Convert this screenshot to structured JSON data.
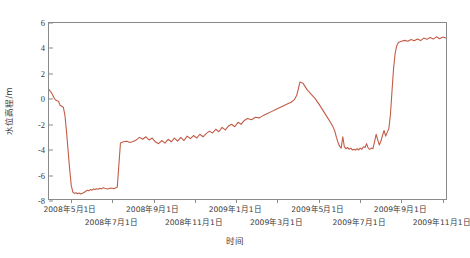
{
  "chart_data": {
    "type": "line",
    "title": "",
    "xlabel": "时间",
    "ylabel": "水位高程/m",
    "ylim": [
      -8,
      6
    ],
    "ytick_values": [
      6,
      4,
      2,
      0,
      -2,
      -4,
      -6,
      -8
    ],
    "ytick_labels": [
      "6",
      "4",
      "2",
      "0",
      "-2",
      "-4",
      "-6",
      "-8"
    ],
    "grid": false,
    "legend": null,
    "line_color": "#c35b46",
    "axis_color": "#8a8a8a",
    "xtick_labels": [
      {
        "text": "2008年5月1日",
        "row": 0,
        "index": 0
      },
      {
        "text": "2008年7月1日",
        "row": 1,
        "index": 1
      },
      {
        "text": "2008年9月1日",
        "row": 0,
        "index": 2
      },
      {
        "text": "2008年11月1日",
        "row": 1,
        "index": 3
      },
      {
        "text": "2009年1月1日",
        "row": 0,
        "index": 4
      },
      {
        "text": "2009年3月1日",
        "row": 1,
        "index": 5
      },
      {
        "text": "2009年5月1日",
        "row": 0,
        "index": 6
      },
      {
        "text": "2009年7月1日",
        "row": 1,
        "index": 7
      },
      {
        "text": "2009年9月1日",
        "row": 0,
        "index": 8
      },
      {
        "text": "2009年11月1日",
        "row": 1,
        "index": 9
      }
    ],
    "x": [
      0.0,
      0.004,
      0.008,
      0.012,
      0.016,
      0.02,
      0.024,
      0.028,
      0.032,
      0.036,
      0.04,
      0.044,
      0.048,
      0.052,
      0.056,
      0.06,
      0.064,
      0.068,
      0.072,
      0.076,
      0.08,
      0.084,
      0.088,
      0.092,
      0.096,
      0.1,
      0.104,
      0.108,
      0.112,
      0.116,
      0.12,
      0.124,
      0.128,
      0.132,
      0.136,
      0.14,
      0.148,
      0.156,
      0.164,
      0.172,
      0.18,
      0.188,
      0.196,
      0.204,
      0.212,
      0.22,
      0.228,
      0.236,
      0.244,
      0.252,
      0.26,
      0.268,
      0.276,
      0.284,
      0.292,
      0.3,
      0.308,
      0.316,
      0.324,
      0.332,
      0.34,
      0.348,
      0.356,
      0.364,
      0.372,
      0.38,
      0.388,
      0.396,
      0.404,
      0.412,
      0.42,
      0.428,
      0.436,
      0.444,
      0.452,
      0.46,
      0.468,
      0.476,
      0.484,
      0.492,
      0.5,
      0.51,
      0.52,
      0.53,
      0.54,
      0.55,
      0.56,
      0.57,
      0.58,
      0.59,
      0.6,
      0.61,
      0.618,
      0.624,
      0.628,
      0.632,
      0.64,
      0.65,
      0.66,
      0.67,
      0.68,
      0.69,
      0.7,
      0.71,
      0.716,
      0.72,
      0.724,
      0.728,
      0.732,
      0.736,
      0.74,
      0.744,
      0.748,
      0.752,
      0.756,
      0.76,
      0.764,
      0.768,
      0.772,
      0.776,
      0.78,
      0.784,
      0.788,
      0.792,
      0.796,
      0.8,
      0.804,
      0.808,
      0.812,
      0.816,
      0.82,
      0.824,
      0.828,
      0.832,
      0.836,
      0.84,
      0.844,
      0.848,
      0.852,
      0.856,
      0.86,
      0.864,
      0.868,
      0.872,
      0.876,
      0.88,
      0.888,
      0.896,
      0.904,
      0.912,
      0.92,
      0.928,
      0.936,
      0.944,
      0.952,
      0.96,
      0.968,
      0.976,
      0.984,
      0.992,
      1.0
    ],
    "y": [
      0.7,
      0.55,
      0.35,
      0.1,
      -0.1,
      -0.18,
      -0.22,
      -0.55,
      -0.62,
      -0.7,
      -1.3,
      -2.6,
      -4.1,
      -5.6,
      -6.9,
      -7.45,
      -7.55,
      -7.5,
      -7.58,
      -7.52,
      -7.6,
      -7.55,
      -7.48,
      -7.4,
      -7.3,
      -7.35,
      -7.25,
      -7.3,
      -7.2,
      -7.25,
      -7.18,
      -7.22,
      -7.15,
      -7.2,
      -7.1,
      -7.15,
      -7.2,
      -7.12,
      -7.18,
      -7.05,
      -3.55,
      -3.45,
      -3.4,
      -3.5,
      -3.42,
      -3.3,
      -3.1,
      -3.25,
      -3.05,
      -3.3,
      -3.15,
      -3.45,
      -3.6,
      -3.35,
      -3.55,
      -3.25,
      -3.45,
      -3.15,
      -3.4,
      -3.1,
      -3.35,
      -3.0,
      -3.2,
      -2.95,
      -3.15,
      -2.85,
      -3.05,
      -2.8,
      -2.6,
      -2.75,
      -2.45,
      -2.65,
      -2.3,
      -2.5,
      -2.2,
      -2.05,
      -2.25,
      -1.9,
      -2.05,
      -1.75,
      -1.6,
      -1.7,
      -1.5,
      -1.55,
      -1.35,
      -1.2,
      -1.05,
      -0.9,
      -0.75,
      -0.6,
      -0.45,
      -0.3,
      -0.1,
      0.25,
      0.75,
      1.3,
      1.2,
      0.7,
      0.35,
      0.0,
      -0.45,
      -0.95,
      -1.45,
      -1.95,
      -2.3,
      -2.6,
      -3.1,
      -3.5,
      -3.8,
      -3.95,
      -3.05,
      -3.85,
      -4.0,
      -3.9,
      -4.05,
      -3.95,
      -4.1,
      -4.05,
      -4.12,
      -4.0,
      -4.1,
      -3.95,
      -4.05,
      -3.85,
      -3.9,
      -3.6,
      -3.95,
      -4.05,
      -3.95,
      -4.0,
      -3.45,
      -2.85,
      -3.3,
      -3.7,
      -3.4,
      -2.95,
      -2.55,
      -3.0,
      -2.7,
      -2.4,
      -1.3,
      0.6,
      2.4,
      3.6,
      4.2,
      4.45,
      4.55,
      4.62,
      4.55,
      4.68,
      4.58,
      4.72,
      4.6,
      4.8,
      4.7,
      4.85,
      4.72,
      4.9,
      4.75,
      4.88,
      4.8
    ]
  }
}
